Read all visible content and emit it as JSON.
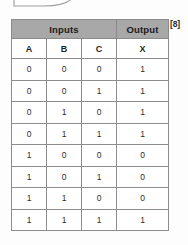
{
  "annotation": {
    "marks": "[8]"
  },
  "diagram": {
    "fragment_name": "logic-gate-outline-fragment",
    "stroke_color": "#9a9a9a"
  },
  "table": {
    "group_headers": [
      {
        "label": "Inputs",
        "span": 3
      },
      {
        "label": "Output",
        "span": 1
      }
    ],
    "columns": [
      "A",
      "B",
      "C",
      "X"
    ],
    "rows": [
      [
        "0",
        "0",
        "0",
        "1"
      ],
      [
        "0",
        "0",
        "1",
        "1"
      ],
      [
        "0",
        "1",
        "0",
        "1"
      ],
      [
        "0",
        "1",
        "1",
        "1"
      ],
      [
        "1",
        "0",
        "0",
        "0"
      ],
      [
        "1",
        "0",
        "1",
        "0"
      ],
      [
        "1",
        "1",
        "0",
        "0"
      ],
      [
        "1",
        "1",
        "1",
        "1"
      ]
    ],
    "header_bg": "#a8a8a8",
    "border_color": "#8d8d8d",
    "body_bg": "#ffffff"
  }
}
